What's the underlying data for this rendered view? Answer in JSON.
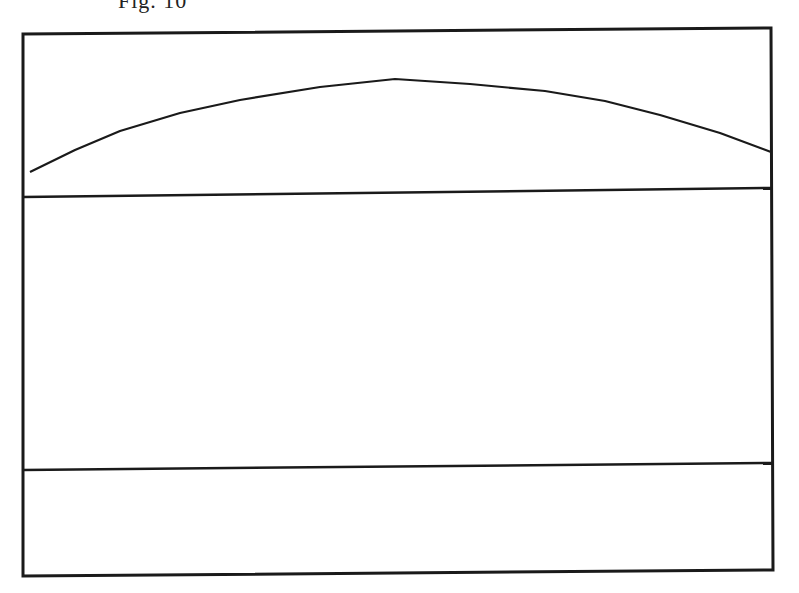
{
  "figure": {
    "caption": "Fig. 10",
    "stroke_color": "#1a1a1a",
    "background": "#ffffff"
  },
  "diagram": {
    "outer_frame": {
      "points": [
        [
          23,
          34
        ],
        [
          771,
          28
        ],
        [
          773,
          570
        ],
        [
          23,
          576
        ]
      ]
    },
    "divider_upper": {
      "from": [
        23,
        197
      ],
      "to": [
        771,
        188
      ]
    },
    "divider_lower": {
      "from": [
        23,
        470
      ],
      "to": [
        773,
        463
      ]
    },
    "arc": {
      "points": [
        [
          30,
          172
        ],
        [
          120,
          131
        ],
        [
          240,
          100
        ],
        [
          395,
          79
        ],
        [
          545,
          91
        ],
        [
          660,
          115
        ],
        [
          771,
          152
        ]
      ]
    },
    "regions": [
      "top-arc-region",
      "middle-region",
      "bottom-region"
    ]
  }
}
